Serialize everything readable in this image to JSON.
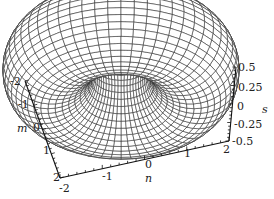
{
  "chart_data": {
    "type": "surface3d",
    "title": "",
    "axes": {
      "m": {
        "label": "m",
        "ticks": [
          "-2",
          "-1",
          "0",
          "1",
          "2"
        ],
        "range": [
          -2,
          2
        ]
      },
      "n": {
        "label": "n",
        "ticks": [
          "-2",
          "-1",
          "0",
          "1",
          "2"
        ],
        "range": [
          -2,
          2
        ]
      },
      "s": {
        "label": "s",
        "ticks": [
          "0.5",
          "0.25",
          "0",
          "-0.25",
          "-0.5"
        ],
        "range": [
          -0.5,
          0.5
        ]
      }
    },
    "surface": {
      "shape": "torus",
      "mesh": "wireframe",
      "line_color": "#222222",
      "fill_color": "#ffffff"
    },
    "grid": false,
    "legend": null
  },
  "labels": {
    "m_ticks": [
      "-2",
      "-1",
      "0",
      "1",
      "2"
    ],
    "n_ticks": [
      "-2",
      "-1",
      "0",
      "1",
      "2"
    ],
    "s_ticks": [
      "0.5",
      "0.25",
      "0",
      "-0.25",
      "-0.5"
    ],
    "m_title": "m",
    "n_title": "n",
    "s_title": "s"
  }
}
